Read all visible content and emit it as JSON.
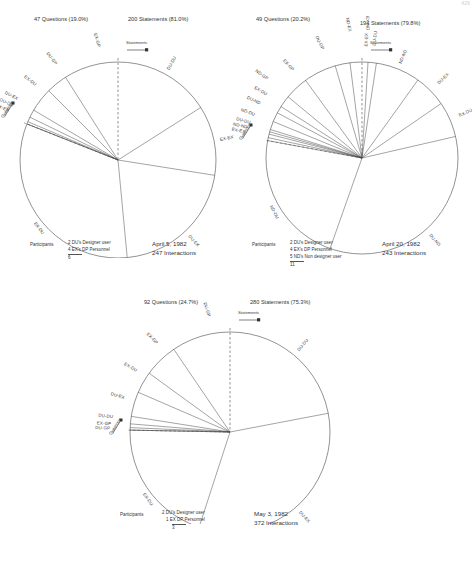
{
  "page_number": "426",
  "legend_labels": {
    "statements": "Statements",
    "questions": "Questions"
  },
  "participants_label": "Participants",
  "charts": [
    {
      "id": "chart-april-5",
      "questions_header": "47 Questions (19.0%)",
      "statements_header": "200 Statements (81.0%)",
      "date": "April 5, 1982",
      "interactions": "247 Interactions",
      "participants": [
        "2 DU's Designer user",
        "4 EX's DP Personnel"
      ],
      "participants_total": "6",
      "chart_data": {
        "type": "pie",
        "title": "April 5, 1982 — 247 Interactions",
        "note": "Interaction-type rose diagram; clockwise from 12 o'clock are statements (81.0%), counter-clockwise are questions (19.0%)",
        "zero_angle_deg": 0,
        "direction": "clockwise = statements, counter-clockwise = questions",
        "slices": [
          {
            "label": "DU-DU",
            "kind": "statement",
            "percent": 16.0
          },
          {
            "label": "EX-EX",
            "kind": "statement",
            "percent": 11.5
          },
          {
            "label": "DU-EX",
            "kind": "statement",
            "percent": 21.0
          },
          {
            "label": "EX-DU",
            "kind": "statement",
            "percent": 32.5
          },
          {
            "label": "EX-GP",
            "kind": "question",
            "percent": 9.0
          },
          {
            "label": "DU-GP",
            "kind": "question",
            "percent": 3.5
          },
          {
            "label": "EX-DU",
            "kind": "question",
            "percent": 4.0
          },
          {
            "label": "DU-EX",
            "kind": "question",
            "percent": 1.3
          },
          {
            "label": "DU-DU",
            "kind": "question",
            "percent": 0.8
          },
          {
            "label": "EX-EX",
            "kind": "question",
            "percent": 0.4
          }
        ]
      }
    },
    {
      "id": "chart-april-20",
      "questions_header": "49 Questions (20.2%)",
      "statements_header": "194 Statements (79.8%)",
      "date": "April 20, 1982",
      "interactions": "243 Interactions",
      "participants": [
        "2 DU's Designer user",
        "4 EX's DP Personnel",
        "5 ND's Non designer user"
      ],
      "participants_total": "11",
      "chart_data": {
        "type": "pie",
        "title": "April 20, 1982 — 243 Interactions",
        "note": "Interaction-type rose diagram; clockwise from 12 o'clock are statements (79.8%), counter-clockwise are questions (20.2%)",
        "zero_angle_deg": 0,
        "direction": "clockwise = statements, counter-clockwise = questions",
        "slices": [
          {
            "label": "EX-EX",
            "kind": "statement",
            "percent": 1.0
          },
          {
            "label": "DU-DU",
            "kind": "statement",
            "percent": 1.4
          },
          {
            "label": "ND-ND",
            "kind": "statement",
            "percent": 7.5
          },
          {
            "label": "DU-EX",
            "kind": "statement",
            "percent": 5.5
          },
          {
            "label": "EX-DU",
            "kind": "statement",
            "percent": 6.0
          },
          {
            "label": "DU-ND",
            "kind": "statement",
            "percent": 34.0
          },
          {
            "label": "ND-DU",
            "kind": "statement",
            "percent": 24.0
          },
          {
            "label": "EX-ND",
            "kind": "question",
            "percent": 2.0
          },
          {
            "label": "ND-EX",
            "kind": "question",
            "percent": 2.5
          },
          {
            "label": "DU-GP",
            "kind": "question",
            "percent": 5.5
          },
          {
            "label": "EX-GP",
            "kind": "question",
            "percent": 4.0
          },
          {
            "label": "ND-GP",
            "kind": "question",
            "percent": 2.0
          },
          {
            "label": "EX-DU",
            "kind": "question",
            "percent": 1.2
          },
          {
            "label": "DU-ND",
            "kind": "question",
            "percent": 1.6
          },
          {
            "label": "ND-DU",
            "kind": "question",
            "percent": 1.4
          },
          {
            "label": "DU-DU",
            "kind": "question",
            "percent": 0.8
          },
          {
            "label": "ND-ND",
            "kind": "question",
            "percent": 0.6
          },
          {
            "label": "EX-EX",
            "kind": "question",
            "percent": 0.5
          }
        ]
      }
    },
    {
      "id": "chart-may-3",
      "questions_header": "92 Questions (24.7%)",
      "statements_header": "280 Statements (75.3%)",
      "date": "May 3, 1982",
      "interactions": "372 Interactions",
      "participants": [
        "2 DU's Designer user",
        "1 EX DP Personnel"
      ],
      "participants_total": "3",
      "chart_data": {
        "type": "pie",
        "title": "May 3, 1982 — 372 Interactions",
        "note": "Interaction-type rose diagram; clockwise from 12 o'clock are statements (75.3%), counter-clockwise are questions (24.7%)",
        "zero_angle_deg": 0,
        "direction": "clockwise = statements, counter-clockwise = questions",
        "slices": [
          {
            "label": "DU-DU",
            "kind": "statement",
            "percent": 22.0
          },
          {
            "label": "DU-EX",
            "kind": "statement",
            "percent": 33.0
          },
          {
            "label": "EX-DU",
            "kind": "statement",
            "percent": 20.3
          },
          {
            "label": "DU-GP",
            "kind": "question",
            "percent": 9.5
          },
          {
            "label": "EX-GP",
            "kind": "question",
            "percent": 5.5
          },
          {
            "label": "EX-DU",
            "kind": "question",
            "percent": 3.5
          },
          {
            "label": "DU-EX",
            "kind": "question",
            "percent": 4.0
          },
          {
            "label": "DU-DU",
            "kind": "question",
            "percent": 1.2
          },
          {
            "label": "EX-GP",
            "kind": "question",
            "percent": 0.6
          },
          {
            "label": "DU-GP",
            "kind": "question",
            "percent": 0.4
          }
        ]
      }
    }
  ]
}
